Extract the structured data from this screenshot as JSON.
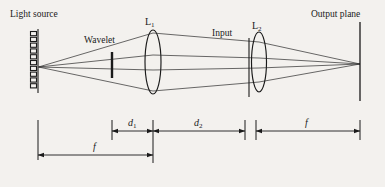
{
  "figure": {
    "type": "optical-ray-diagram",
    "background_color": "#f3f1ee",
    "ink_color": "#1a1a1a",
    "width": 385,
    "height": 187
  },
  "labels": {
    "light_source": "Light source",
    "wavelet": "Wavelet",
    "lens1": "L",
    "lens1_sub": "1",
    "input": "Input",
    "lens2": "L",
    "lens2_sub": "2",
    "output_plane": "Output plane"
  },
  "dimensions": {
    "f_source_to_lens1": "f",
    "d1_wavelet_to_lens1": "d",
    "d1_sub": "1",
    "d2_lens1_to_lens2": "d",
    "d2_sub": "2",
    "f_lens2_to_output": "f"
  },
  "components": {
    "source": {
      "name": "light-source-grating",
      "x": 38,
      "y_top": 30,
      "y_bottom": 92,
      "teeth": 11
    },
    "wavelet": {
      "name": "wavelet-aperture",
      "x": 112,
      "y_top": 52,
      "y_bottom": 78
    },
    "lens1": {
      "name": "lens-L1",
      "cx": 153,
      "cy": 62,
      "rx": 8,
      "ry": 32
    },
    "input": {
      "name": "input-plane",
      "x": 249,
      "y_top": 38,
      "y_bottom": 96
    },
    "lens2": {
      "name": "lens-L2",
      "cx": 259,
      "cy": 62,
      "rx": 7.5,
      "ry": 30
    },
    "output": {
      "name": "output-plane",
      "x": 360,
      "y_top": 22,
      "y_bottom": 100
    }
  },
  "rays": {
    "source_point_y": 67,
    "focus_point": {
      "x": 360,
      "y": 64
    },
    "count": 4
  }
}
